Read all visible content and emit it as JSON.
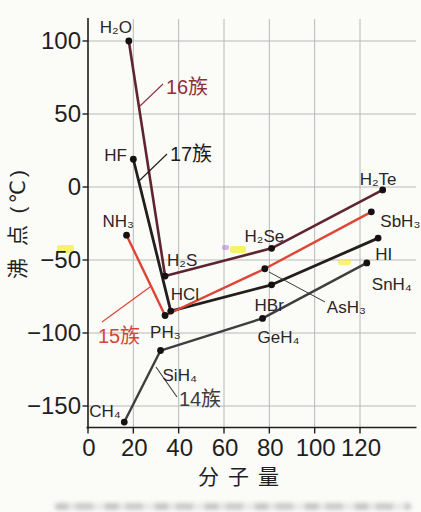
{
  "figure": {
    "background": "#fbfbf8",
    "x_axis": {
      "label": "分子量",
      "ticks": [
        {
          "value": 0,
          "label": "0"
        },
        {
          "value": 20,
          "label": "20"
        },
        {
          "value": 40,
          "label": "40"
        },
        {
          "value": 60,
          "label": "60"
        },
        {
          "value": 80,
          "label": "80"
        },
        {
          "value": 100,
          "label": "100"
        },
        {
          "value": 120,
          "label": "120"
        }
      ]
    },
    "y_axis": {
      "label": "沸 点 (℃)",
      "ticks": [
        {
          "value": 100,
          "label": "100"
        },
        {
          "value": 50,
          "label": "50"
        },
        {
          "value": 0,
          "label": "0"
        },
        {
          "value": -50,
          "label": "−50"
        },
        {
          "value": -100,
          "label": "−100"
        },
        {
          "value": -150,
          "label": "−150"
        }
      ]
    }
  },
  "chart_data": {
    "type": "line",
    "title": "",
    "xlabel": "分子量",
    "ylabel": "沸点(℃)",
    "xlim": [
      0,
      145
    ],
    "ylim": [
      -165,
      116
    ],
    "grid": true,
    "legend": "inline-annotations",
    "series": [
      {
        "name": "14族",
        "color": "#3f3e3e",
        "points": [
          {
            "label": "CH₄",
            "x": 16,
            "y": -161
          },
          {
            "label": "SiH₄",
            "x": 32,
            "y": -112
          },
          {
            "label": "GeH₄",
            "x": 77,
            "y": -90
          },
          {
            "label": "SnH₄",
            "x": 123,
            "y": -52
          }
        ]
      },
      {
        "name": "15族",
        "color": "#de4537",
        "points": [
          {
            "label": "NH₃",
            "x": 17,
            "y": -33
          },
          {
            "label": "PH₃",
            "x": 34,
            "y": -88
          },
          {
            "label": "AsH₃",
            "x": 78,
            "y": -56
          },
          {
            "label": "SbH₃",
            "x": 125,
            "y": -17
          }
        ]
      },
      {
        "name": "16族",
        "color": "#5e2530",
        "points": [
          {
            "label": "H₂O",
            "x": 18,
            "y": 100
          },
          {
            "label": "H₂S",
            "x": 34,
            "y": -61
          },
          {
            "label": "H₂Se",
            "x": 81,
            "y": -42
          },
          {
            "label": "H₂Te",
            "x": 130,
            "y": -2
          }
        ]
      },
      {
        "name": "17族",
        "color": "#221e1e",
        "points": [
          {
            "label": "HF",
            "x": 20,
            "y": 19
          },
          {
            "label": "HCl",
            "x": 36.5,
            "y": -85
          },
          {
            "label": "HBr",
            "x": 81,
            "y": -67
          },
          {
            "label": "HI",
            "x": 128,
            "y": -35
          }
        ]
      }
    ],
    "annotations": [
      {
        "text": "16族",
        "color": "#8d3138"
      },
      {
        "text": "17族",
        "color": "#1c1c1c"
      },
      {
        "text": "15族",
        "color": "#d84335"
      },
      {
        "text": "14族",
        "color": "#3c3c3c"
      }
    ]
  }
}
